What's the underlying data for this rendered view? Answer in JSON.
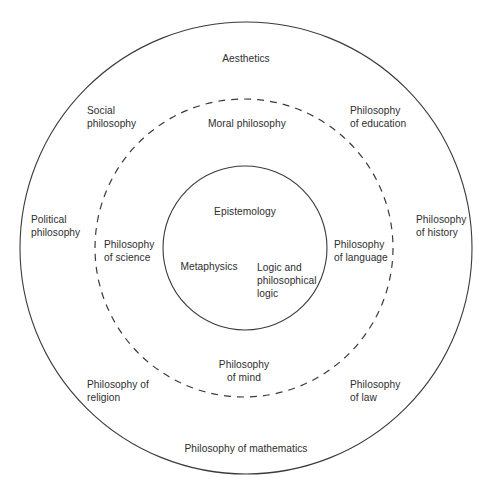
{
  "diagram": {
    "background_color": "#ffffff",
    "stroke_color": "#3a3a3a",
    "text_color": "#2e2e2e",
    "rings": [
      {
        "name": "core",
        "style": "solid",
        "cx": 245,
        "cy": 248,
        "r": 82
      },
      {
        "name": "middle",
        "style": "dashed",
        "cx": 244,
        "cy": 248,
        "r": 149
      },
      {
        "name": "outer",
        "style": "solid",
        "cx": 246,
        "cy": 248,
        "r": 226
      }
    ],
    "core_labels": [
      {
        "key": "epistemology",
        "text": "Epistemology",
        "x": 245,
        "y": 205,
        "align": "center"
      },
      {
        "key": "metaphysics",
        "text": "Metaphysics",
        "x": 209,
        "y": 260,
        "align": "center"
      },
      {
        "key": "logic",
        "text": "Logic and\nphilosophical\nlogic",
        "x": 257,
        "y": 261,
        "align": "left"
      }
    ],
    "middle_labels": [
      {
        "key": "moral-philosophy",
        "text": "Moral philosophy",
        "x": 247,
        "y": 117,
        "align": "center"
      },
      {
        "key": "philosophy-of-science",
        "text": "Philosophy\nof science",
        "x": 104,
        "y": 238,
        "align": "left"
      },
      {
        "key": "philosophy-of-language",
        "text": "Philosophy\nof language",
        "x": 334,
        "y": 238,
        "align": "left"
      },
      {
        "key": "philosophy-of-mind",
        "text": "Philosophy\nof mind",
        "x": 244,
        "y": 358,
        "align": "center"
      }
    ],
    "outer_labels": [
      {
        "key": "aesthetics",
        "text": "Aesthetics",
        "x": 246,
        "y": 52,
        "align": "center"
      },
      {
        "key": "social-philosophy",
        "text": "Social\nphilosophy",
        "x": 87,
        "y": 104,
        "align": "left"
      },
      {
        "key": "philosophy-of-education",
        "text": "Philosophy\nof education",
        "x": 350,
        "y": 104,
        "align": "left"
      },
      {
        "key": "political-philosophy",
        "text": "Political\nphilosophy",
        "x": 31,
        "y": 213,
        "align": "left"
      },
      {
        "key": "philosophy-of-history",
        "text": "Philosophy\nof history",
        "x": 416,
        "y": 213,
        "align": "left"
      },
      {
        "key": "philosophy-of-religion",
        "text": "Philosophy of\nreligion",
        "x": 87,
        "y": 378,
        "align": "left"
      },
      {
        "key": "philosophy-of-law",
        "text": "Philosophy\nof law",
        "x": 350,
        "y": 378,
        "align": "left"
      },
      {
        "key": "philosophy-of-mathematics",
        "text": "Philosophy of mathematics",
        "x": 246,
        "y": 442,
        "align": "center"
      }
    ]
  }
}
